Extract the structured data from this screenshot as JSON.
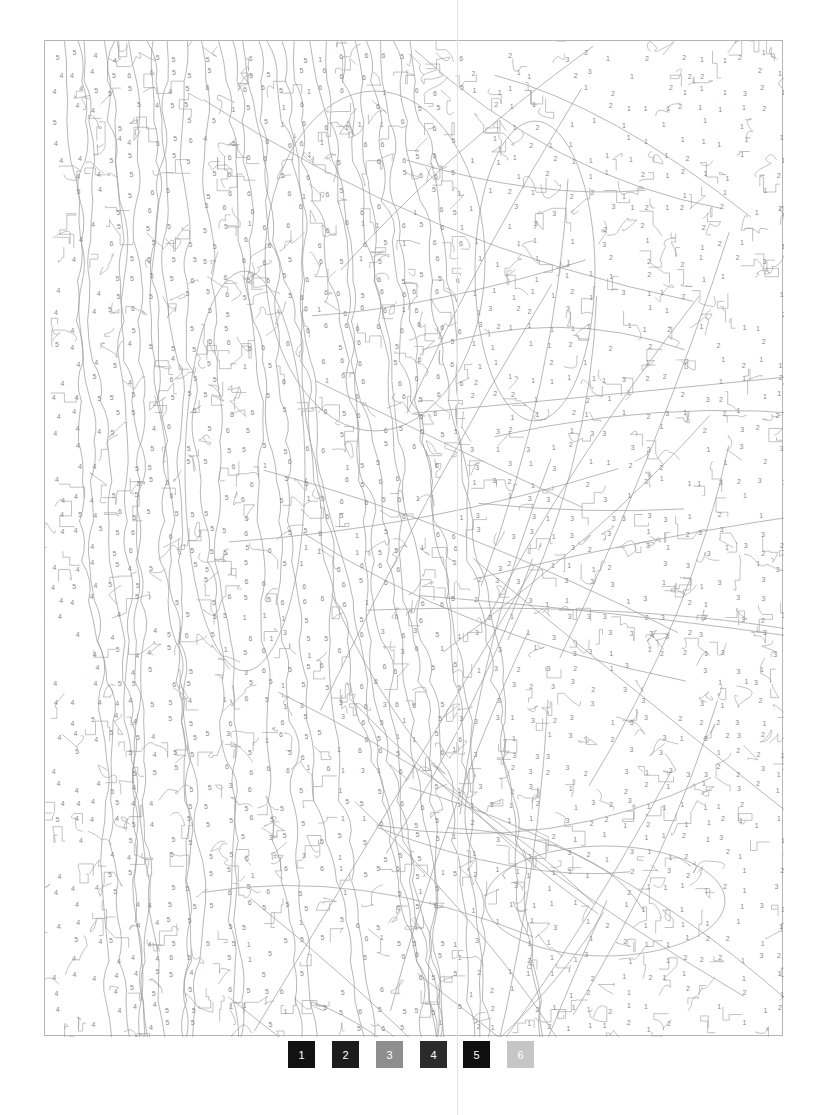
{
  "page": {
    "type": "color-by-number",
    "background": "#ffffff"
  },
  "artwork": {
    "stroke_color": "#9a9a9a",
    "number_color": "#8a8a8a",
    "frame": {
      "x": 44,
      "y": 40,
      "width": 739,
      "height": 996
    },
    "regions": [
      {
        "area": "left-edge",
        "dominant_number": "4"
      },
      {
        "area": "left-center-column",
        "dominant_number": "5"
      },
      {
        "area": "upper-center",
        "dominant_number": "6"
      },
      {
        "area": "upper-right",
        "dominant_numbers": [
          "1",
          "2"
        ]
      },
      {
        "area": "center-right",
        "dominant_number": "3"
      },
      {
        "area": "lower-right",
        "dominant_numbers": [
          "1",
          "2"
        ]
      },
      {
        "area": "lower-center",
        "dominant_numbers": [
          "5",
          "6"
        ]
      }
    ]
  },
  "legend": {
    "swatches": [
      {
        "number": "1",
        "color": "#121212"
      },
      {
        "number": "2",
        "color": "#1c1c1c"
      },
      {
        "number": "3",
        "color": "#8e8e8e"
      },
      {
        "number": "4",
        "color": "#2b2b2b"
      },
      {
        "number": "5",
        "color": "#0f0f0f"
      },
      {
        "number": "6",
        "color": "#c6c6c6"
      }
    ]
  }
}
